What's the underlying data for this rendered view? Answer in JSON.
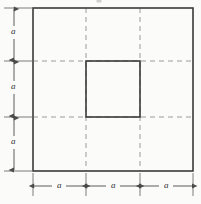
{
  "figure": {
    "kind": "geometry-diagram",
    "background_color": "#fbfbfa",
    "solid_line_color": "#3a3a3a",
    "dashed_line_color": "#9a9a9a",
    "dimension_line_color": "#4a4a4a",
    "top_crop_mark": {
      "visible": true,
      "note": "faint clipped glyph remnant at top edge, center"
    }
  },
  "outer_square": {
    "name": "outer-square",
    "left": 33,
    "top": 8,
    "right": 193,
    "bottom": 171,
    "width": 160,
    "height": 163,
    "stroke_width": 1.6
  },
  "inner_square": {
    "name": "inner-square",
    "left": 86,
    "top": 61,
    "right": 140,
    "bottom": 117,
    "width": 54,
    "height": 56,
    "stroke_width": 1.6
  },
  "grid": {
    "vertical_dashed_x": [
      86,
      140
    ],
    "horizontal_dashed_y": [
      61,
      117
    ],
    "dash_pattern": "5,4"
  },
  "dimensions": {
    "vertical": {
      "name": "left-dimension-stack",
      "axis_x": 14,
      "segments": [
        {
          "label": "a",
          "from": 8,
          "to": 61,
          "label_y": 32
        },
        {
          "label": "a",
          "from": 61,
          "to": 117,
          "label_y": 87
        },
        {
          "label": "a",
          "from": 117,
          "to": 171,
          "label_y": 142
        }
      ],
      "extension_ys": [
        8,
        61,
        117,
        171
      ]
    },
    "horizontal": {
      "name": "bottom-dimension-stack",
      "axis_y": 186,
      "segments": [
        {
          "label": "a",
          "from": 33,
          "to": 86,
          "label_x": 59
        },
        {
          "label": "a",
          "from": 86,
          "to": 140,
          "label_x": 113
        },
        {
          "label": "a",
          "from": 140,
          "to": 193,
          "label_x": 166
        }
      ],
      "extension_xs": [
        33,
        86,
        140,
        193
      ]
    }
  }
}
